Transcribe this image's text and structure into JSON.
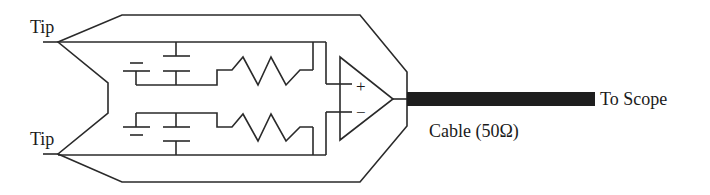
{
  "diagram": {
    "type": "circuit-schematic",
    "labels": {
      "tip_top": "Tip",
      "tip_bottom": "Tip",
      "to_scope": "To Scope",
      "cable": "Cable (50Ω)",
      "opamp_plus": "+",
      "opamp_minus": "−"
    },
    "components": [
      {
        "id": "battery-top",
        "kind": "dc-source"
      },
      {
        "id": "capacitor-top",
        "kind": "capacitor"
      },
      {
        "id": "resistor-top",
        "kind": "resistor"
      },
      {
        "id": "battery-bottom",
        "kind": "dc-source"
      },
      {
        "id": "capacitor-bottom",
        "kind": "capacitor"
      },
      {
        "id": "resistor-bottom",
        "kind": "resistor"
      },
      {
        "id": "opamp",
        "kind": "differential-amplifier"
      },
      {
        "id": "cable",
        "kind": "coax-cable",
        "impedance": "50Ω"
      }
    ],
    "colors": {
      "line": "#2a2a2a",
      "cable": "#1e1e1e",
      "background": "#ffffff"
    }
  }
}
